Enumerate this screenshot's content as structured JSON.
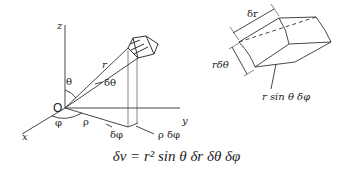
{
  "left_diagram": {
    "axis_labels": {
      "z": "z",
      "y": "y",
      "x": "x",
      "origin": "O"
    },
    "labels": {
      "r": "r",
      "theta": "θ",
      "dtheta": "δθ",
      "phi": "φ",
      "rho": "ρ",
      "dphi": "δφ",
      "rho_dphi": "ρ δφ"
    }
  },
  "right_diagram": {
    "labels": {
      "dr": "δr",
      "r_dtheta": "rδθ",
      "r_sin_theta_dphi": "r sin θ δφ"
    }
  },
  "formula": {
    "text": "δv = r² sin θ δr δθ δφ"
  }
}
